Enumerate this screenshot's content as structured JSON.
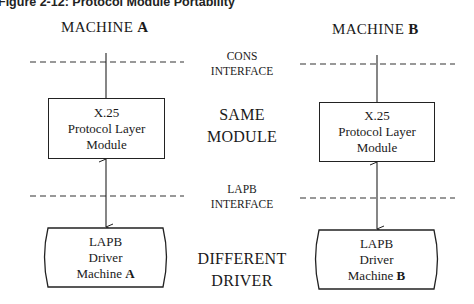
{
  "caption": "Figure 2-12:  Protocol Module Portability",
  "machines": [
    {
      "label_prefix": "MACHINE ",
      "label_letter": "A",
      "module": {
        "line1": "X.25",
        "line2": "Protocol Layer",
        "line3": "Module"
      },
      "driver": {
        "line1": "LAPB",
        "line2": "Driver",
        "line3_prefix": "Machine ",
        "line3_letter": "A"
      }
    },
    {
      "label_prefix": "MACHINE ",
      "label_letter": "B",
      "module": {
        "line1": "X.25",
        "line2": "Protocol Layer",
        "line3": "Module"
      },
      "driver": {
        "line1": "LAPB",
        "line2": "Driver",
        "line3_prefix": "Machine ",
        "line3_letter": "B"
      }
    }
  ],
  "interfaces": {
    "cons": {
      "line1": "CONS",
      "line2": "INTERFACE"
    },
    "lapb": {
      "line1": "LAPB",
      "line2": "INTERFACE"
    }
  },
  "center_labels": {
    "same": {
      "line1": "SAME",
      "line2": "MODULE"
    },
    "different": {
      "line1": "DIFFERENT",
      "line2": "DRIVER"
    }
  }
}
